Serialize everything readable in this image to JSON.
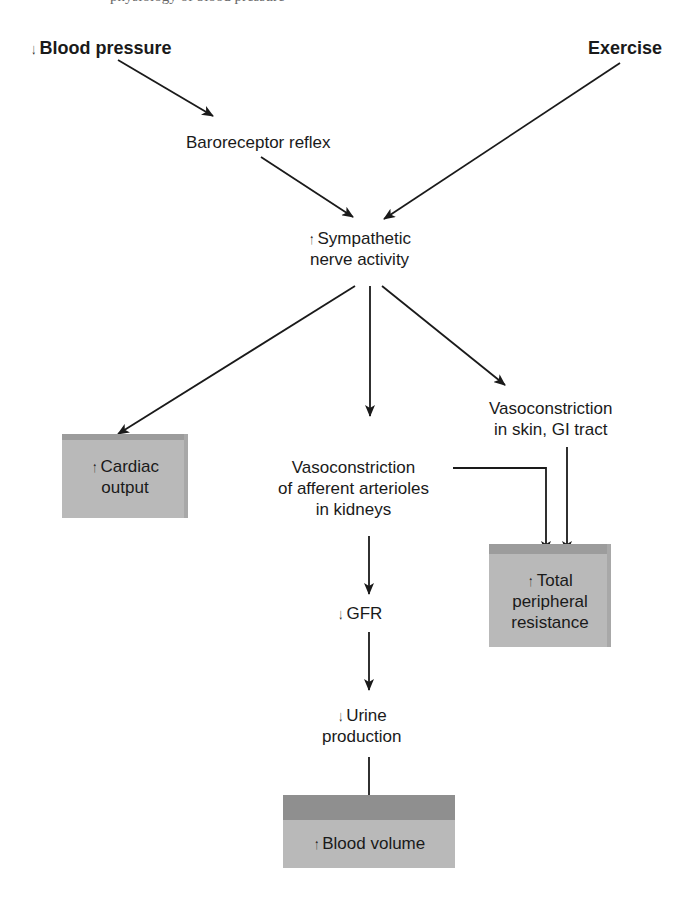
{
  "header_fragment": "physiology of blood pressure",
  "inputs": {
    "blood_pressure": {
      "arrow": "↓",
      "label": "Blood pressure"
    },
    "exercise": {
      "label": "Exercise"
    }
  },
  "nodes": {
    "baroreceptor": "Baroreceptor reflex",
    "sympathetic": {
      "arrow": "↑",
      "line1": "Sympathetic",
      "line2": "nerve activity"
    },
    "vaso_skin": {
      "line1": "Vasoconstriction",
      "line2": "in skin, GI tract"
    },
    "vaso_kidney": {
      "line1": "Vasoconstriction",
      "line2": "of afferent arterioles",
      "line3": "in kidneys"
    },
    "gfr": {
      "arrow": "↓",
      "label": "GFR"
    },
    "urine": {
      "arrow": "↓",
      "line1": "Urine",
      "line2": "production"
    }
  },
  "outcomes": {
    "cardiac_output": {
      "arrow": "↑",
      "line1": "Cardiac",
      "line2": "output"
    },
    "tpr": {
      "arrow": "↑",
      "line1": "Total",
      "line2": "peripheral",
      "line3": "resistance"
    },
    "blood_volume": {
      "arrow": "↑",
      "label": "Blood volume"
    }
  },
  "colors": {
    "box_face": "#b9b9b9",
    "box_top": "#9c9c9c",
    "line": "#1a1a1a"
  }
}
